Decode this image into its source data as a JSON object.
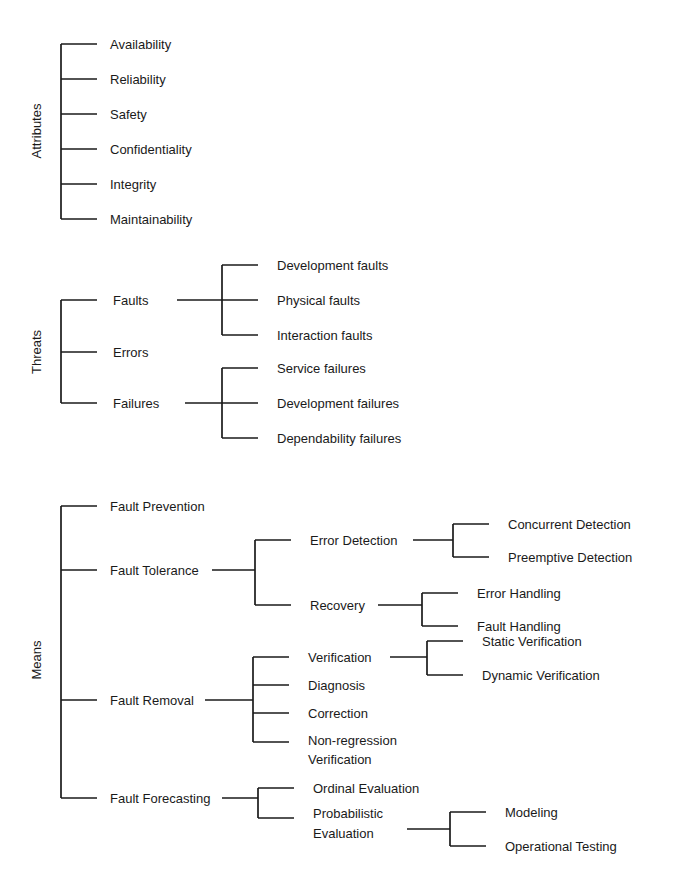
{
  "diagram": {
    "line_color": "#1a1a1a",
    "text_color": "#1a1a1a",
    "background": "#ffffff"
  },
  "groups": {
    "attributes": {
      "label": "Attributes",
      "items": [
        "Availability",
        "Reliability",
        "Safety",
        "Confidentiality",
        "Integrity",
        "Maintainability"
      ]
    },
    "threats": {
      "label": "Threats",
      "items": [
        "Faults",
        "Errors",
        "Failures"
      ],
      "faults_children": [
        "Development faults",
        "Physical faults",
        "Interaction faults"
      ],
      "failures_children": [
        "Service failures",
        "Development failures",
        "Dependability failures"
      ]
    },
    "means": {
      "label": "Means",
      "items": [
        "Fault Prevention",
        "Fault Tolerance",
        "Fault Removal",
        "Fault Forecasting"
      ],
      "fault_tolerance_children": [
        "Error Detection",
        "Recovery"
      ],
      "error_detection_children": [
        "Concurrent Detection",
        "Preemptive Detection"
      ],
      "recovery_children": [
        "Error Handling",
        "Fault Handling"
      ],
      "fault_removal_children": [
        "Verification",
        "Diagnosis",
        "Correction",
        "Non-regression",
        "Verification"
      ],
      "verification_children": [
        "Static Verification",
        "Dynamic Verification"
      ],
      "fault_forecasting_children": [
        "Ordinal Evaluation",
        "Probabilistic",
        "Evaluation"
      ],
      "probabilistic_children": [
        "Modeling",
        "Operational Testing"
      ]
    }
  }
}
